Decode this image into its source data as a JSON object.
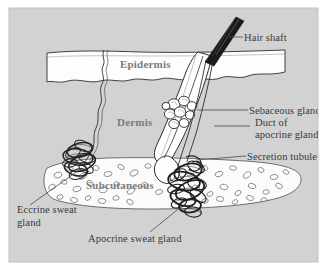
{
  "figure": {
    "kind": "anatomical-diagram",
    "panel": {
      "background_color": "#d2d2d2",
      "page_color": "#ffffff",
      "border_color": "#c4c4c4"
    }
  },
  "layers": [
    {
      "id": "epidermis",
      "label": "Epidermis",
      "text_color": "#7b7b7b",
      "fill_color": "#fdfdfd"
    },
    {
      "id": "dermis",
      "label": "Dermis",
      "text_color": "#7b7b7b",
      "fill_color": "#d2d2d2"
    },
    {
      "id": "subcutaneous",
      "label": "Subcutaneous",
      "text_color": "#7b7b7b",
      "fill_color": "#fbfbfb"
    }
  ],
  "callouts": [
    {
      "id": "hair-shaft",
      "label": "Hair shaft"
    },
    {
      "id": "sebaceous-gland",
      "label": "Sebaceous gland"
    },
    {
      "id": "duct-of",
      "label": "Duct of"
    },
    {
      "id": "apocrine-gland",
      "label": "apocrine gland"
    },
    {
      "id": "secretion-tubule",
      "label": "Secretion tubule"
    },
    {
      "id": "eccrine-sweat",
      "label": "Eccrine sweat"
    },
    {
      "id": "eccrine-gland-2",
      "label": "gland"
    },
    {
      "id": "apocrine-sweat-gland",
      "label": "Apocrine sweat gland"
    }
  ],
  "structures": [
    {
      "id": "hair-shaft-bar",
      "name": "hair shaft"
    },
    {
      "id": "hair-follicle",
      "name": "hair follicle"
    },
    {
      "id": "sebaceous-cluster",
      "name": "sebaceous gland lobules"
    },
    {
      "id": "eccrine-coil",
      "name": "eccrine sweat gland coil"
    },
    {
      "id": "eccrine-duct",
      "name": "eccrine sweat duct"
    },
    {
      "id": "apocrine-coil",
      "name": "apocrine sweat gland coil"
    },
    {
      "id": "apocrine-duct",
      "name": "apocrine duct"
    },
    {
      "id": "fat-cells",
      "name": "subcutaneous fat cells"
    }
  ]
}
